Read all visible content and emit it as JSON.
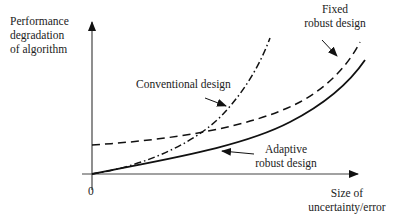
{
  "diagram": {
    "y_axis_label": [
      "Performance",
      "degradation",
      "of algorithm"
    ],
    "x_axis_label": [
      "Size of",
      "uncertainty/error"
    ],
    "origin_label": "0",
    "curves": [
      {
        "name": "Conventional design",
        "style": "dash-dot",
        "label_lines": [
          "Conventional design"
        ]
      },
      {
        "name": "Fixed robust design",
        "style": "dashed",
        "label_lines": [
          "Fixed",
          "robust design"
        ]
      },
      {
        "name": "Adaptive robust design",
        "style": "solid",
        "label_lines": [
          "Adaptive",
          "robust design"
        ]
      }
    ],
    "colors": {
      "line": "#111111",
      "axis": "#444444",
      "text": "#222222"
    }
  }
}
